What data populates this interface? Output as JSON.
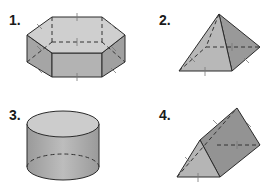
{
  "figures": [
    {
      "label": "1.",
      "shape": "hexagonal-prism"
    },
    {
      "label": "2.",
      "shape": "square-pyramid"
    },
    {
      "label": "3.",
      "shape": "cylinder"
    },
    {
      "label": "4.",
      "shape": "triangular-prism"
    }
  ],
  "colors": {
    "edge": "#2a2a2a",
    "face_light": "#c8c8c8",
    "face_mid": "#a9a9a9",
    "face_dark": "#8f8f8f",
    "tick": "#777777",
    "background": "#ffffff"
  }
}
